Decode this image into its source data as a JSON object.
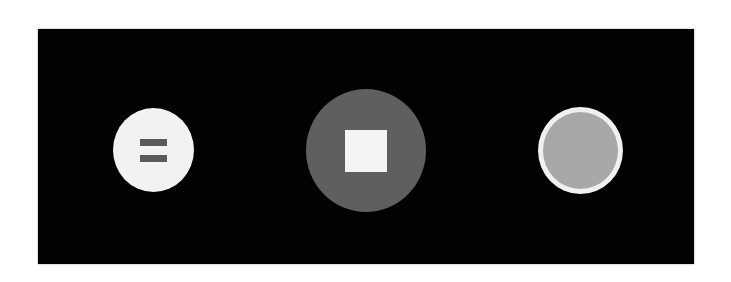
{
  "controls": {
    "background_color": "#020202",
    "buttons": [
      {
        "id": "pause",
        "icon": "pause-icon",
        "fill": "#f2f2f2",
        "glyph_color": "#5a5a5a",
        "label": ""
      },
      {
        "id": "stop",
        "icon": "stop-icon",
        "fill": "#5f5f5f",
        "glyph_color": "#f4f4f4",
        "label": ""
      },
      {
        "id": "record",
        "icon": "record-icon",
        "fill": "#a8a8a8",
        "ring_color": "#f0f0f0",
        "label": ""
      }
    ]
  }
}
